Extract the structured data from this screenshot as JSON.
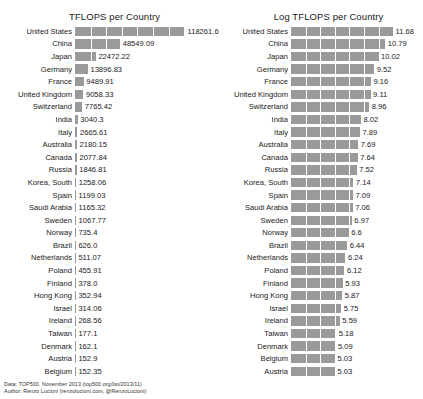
{
  "footer": {
    "line1": "Data: TOP500, November 2013 (top500.org/list/2013/11)",
    "line2": "Author: Renzo Lucioni (renzolucioni.com, @RenzoLucioni)"
  },
  "colors": {
    "bar": "#9a9a9a",
    "gridline": "#ffffff",
    "text": "#1a1a1a",
    "background": "#ffffff"
  },
  "chart_data": [
    {
      "type": "bar",
      "orientation": "horizontal",
      "title": "TFLOPS per Country",
      "xlabel": "",
      "ylabel": "",
      "grid": true,
      "legend": "none",
      "xlim": [
        0,
        118261.6
      ],
      "categories": [
        "United States",
        "China",
        "Japan",
        "Germany",
        "France",
        "United Kingdom",
        "Switzerland",
        "India",
        "Italy",
        "Australia",
        "Canada",
        "Russia",
        "Korea, South",
        "Spain",
        "Saudi Arabia",
        "Sweden",
        "Norway",
        "Brazil",
        "Netherlands",
        "Poland",
        "Finland",
        "Hong Kong",
        "Israel",
        "Ireland",
        "Taiwan",
        "Denmark",
        "Austria",
        "Belgium"
      ],
      "values": [
        118261.6,
        48549.09,
        22472.22,
        13896.83,
        9489.91,
        9058.33,
        7765.42,
        3040.3,
        2665.61,
        2180.15,
        2077.84,
        1846.81,
        1258.06,
        1199.03,
        1165.32,
        1067.77,
        735.4,
        626.0,
        511.07,
        455.91,
        378.0,
        352.94,
        314.06,
        268.56,
        177.1,
        162.1,
        152.9,
        152.35
      ],
      "value_labels": [
        "118261.6",
        "48549.09",
        "22472.22",
        "13896.83",
        "9489.91",
        "9058.33",
        "7765.42",
        "3040.3",
        "2665.61",
        "2180.15",
        "2077.84",
        "1846.81",
        "1258.06",
        "1199.03",
        "1165.32",
        "1067.77",
        "735.4",
        "626.0",
        "511.07",
        "455.91",
        "378.0",
        "352.94",
        "314.06",
        "268.56",
        "177.1",
        "162.1",
        "152.9",
        "152.35"
      ]
    },
    {
      "type": "bar",
      "orientation": "horizontal",
      "title": "Log TFLOPS per Country",
      "xlabel": "",
      "ylabel": "",
      "grid": true,
      "legend": "none",
      "xlim": [
        0,
        11.68
      ],
      "categories": [
        "United States",
        "China",
        "Japan",
        "Germany",
        "France",
        "United Kingdom",
        "Switzerland",
        "India",
        "Italy",
        "Australia",
        "Canada",
        "Russia",
        "Korea, South",
        "Spain",
        "Saudi Arabia",
        "Sweden",
        "Norway",
        "Brazil",
        "Netherlands",
        "Poland",
        "Finland",
        "Hong Kong",
        "Israel",
        "Ireland",
        "Taiwan",
        "Denmark",
        "Belgium",
        "Austria"
      ],
      "values": [
        11.68,
        10.79,
        10.02,
        9.52,
        9.16,
        9.11,
        8.96,
        8.02,
        7.89,
        7.69,
        7.64,
        7.52,
        7.14,
        7.09,
        7.06,
        6.97,
        6.6,
        6.44,
        6.24,
        6.12,
        5.93,
        5.87,
        5.75,
        5.59,
        5.18,
        5.09,
        5.03,
        5.03
      ],
      "value_labels": [
        "11.68",
        "10.79",
        "10.02",
        "9.52",
        "9.16",
        "9.11",
        "8.96",
        "8.02",
        "7.89",
        "7.69",
        "7.64",
        "7.52",
        "7.14",
        "7.09",
        "7.06",
        "6.97",
        "6.6",
        "6.44",
        "6.24",
        "6.12",
        "5.93",
        "5.87",
        "5.75",
        "5.59",
        "5.18",
        "5.09",
        "5.03",
        "5.03"
      ]
    }
  ]
}
